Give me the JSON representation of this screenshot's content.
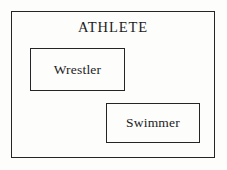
{
  "diagram": {
    "type": "set-diagram",
    "colors": {
      "background": "#fdfdfc",
      "stroke": "#252525",
      "text": "#1c1c1c"
    },
    "universal_set": {
      "label": "ATHLETE",
      "shape": "rectangle"
    },
    "subsets": [
      {
        "label": "Wrestler",
        "shape": "rectangle"
      },
      {
        "label": "Swimmer",
        "shape": "rectangle"
      }
    ]
  }
}
